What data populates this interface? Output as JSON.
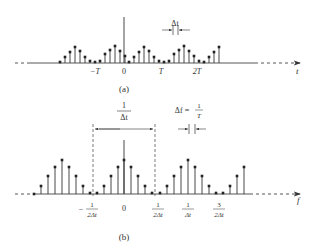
{
  "panel_a": {
    "caption": "(a)",
    "axis_label": "t",
    "tick_labels": [
      {
        "text": "−T",
        "x": 95
      },
      {
        "text": "0",
        "x": 124
      },
      {
        "text": "T",
        "x": 161
      },
      {
        "text": "2T",
        "x": 197
      }
    ],
    "delta_label": "Δt",
    "stem_spacing": 5,
    "center_x": 124,
    "axis_y": 63,
    "center_impulse_top": 17,
    "stems": [
      {
        "x": 60,
        "h": 1
      },
      {
        "x": 65,
        "h": 6
      },
      {
        "x": 70,
        "h": 11
      },
      {
        "x": 75,
        "h": 16
      },
      {
        "x": 80,
        "h": 12
      },
      {
        "x": 85,
        "h": 6
      },
      {
        "x": 90,
        "h": 2
      },
      {
        "x": 95,
        "h": 1
      },
      {
        "x": 100,
        "h": 2
      },
      {
        "x": 105,
        "h": 9
      },
      {
        "x": 110,
        "h": 13
      },
      {
        "x": 115,
        "h": 17
      },
      {
        "x": 120,
        "h": 12
      },
      {
        "x": 125,
        "h": 7
      },
      {
        "x": 129,
        "h": 1
      },
      {
        "x": 134,
        "h": 6
      },
      {
        "x": 139,
        "h": 11
      },
      {
        "x": 144,
        "h": 16
      },
      {
        "x": 149,
        "h": 12
      },
      {
        "x": 154,
        "h": 6
      },
      {
        "x": 159,
        "h": 2
      },
      {
        "x": 164,
        "h": 1
      },
      {
        "x": 169,
        "h": 2
      },
      {
        "x": 174,
        "h": 9
      },
      {
        "x": 179,
        "h": 13
      },
      {
        "x": 184,
        "h": 17
      },
      {
        "x": 189,
        "h": 12
      },
      {
        "x": 194,
        "h": 7
      },
      {
        "x": 199,
        "h": 2
      },
      {
        "x": 204,
        "h": 1
      },
      {
        "x": 209,
        "h": 6
      },
      {
        "x": 214,
        "h": 11
      },
      {
        "x": 219,
        "h": 16
      }
    ]
  },
  "panel_b": {
    "caption": "(b)",
    "axis_label": "f",
    "tick_labels": [
      {
        "sign": "−",
        "num": "1",
        "den": "2Δt",
        "x": 92
      },
      {
        "text": "0",
        "x": 124
      },
      {
        "num": "1",
        "den": "2Δt",
        "x": 158
      },
      {
        "num": "1",
        "den": "Δt",
        "x": 188
      },
      {
        "num": "3",
        "den": "2Δt",
        "x": 219
      }
    ],
    "period_label": {
      "num": "1",
      "den": "Δt"
    },
    "delta_f_label": {
      "lhs": "Δf =",
      "num": "1",
      "den": "T"
    },
    "stem_spacing": 7,
    "center_x": 124,
    "axis_y": 194,
    "stems": [
      {
        "x": 34,
        "h": 0
      },
      {
        "x": 41,
        "h": 8
      },
      {
        "x": 48,
        "h": 18
      },
      {
        "x": 55,
        "h": 27
      },
      {
        "x": 62,
        "h": 34
      },
      {
        "x": 69,
        "h": 27
      },
      {
        "x": 76,
        "h": 18
      },
      {
        "x": 83,
        "h": 8
      },
      {
        "x": 90,
        "h": 1
      },
      {
        "x": 97,
        "h": 1
      },
      {
        "x": 104,
        "h": 8
      },
      {
        "x": 111,
        "h": 18
      },
      {
        "x": 118,
        "h": 27
      },
      {
        "x": 124,
        "h": 34
      },
      {
        "x": 131,
        "h": 27
      },
      {
        "x": 138,
        "h": 18
      },
      {
        "x": 145,
        "h": 8
      },
      {
        "x": 152,
        "h": 1
      },
      {
        "x": 160,
        "h": 1
      },
      {
        "x": 167,
        "h": 8
      },
      {
        "x": 174,
        "h": 18
      },
      {
        "x": 181,
        "h": 27
      },
      {
        "x": 188,
        "h": 34
      },
      {
        "x": 195,
        "h": 27
      },
      {
        "x": 202,
        "h": 18
      },
      {
        "x": 209,
        "h": 8
      },
      {
        "x": 216,
        "h": 1
      },
      {
        "x": 223,
        "h": 1
      },
      {
        "x": 230,
        "h": 8
      },
      {
        "x": 237,
        "h": 18
      },
      {
        "x": 244,
        "h": 27
      }
    ],
    "center_impulse_top": 140,
    "dashed_lines_x": [
      93,
      155
    ]
  }
}
